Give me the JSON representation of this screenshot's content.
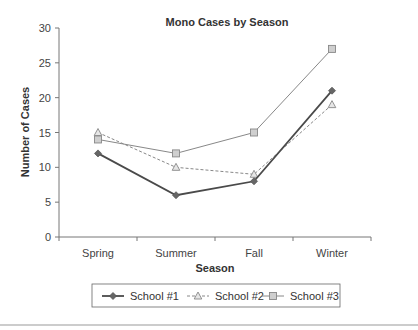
{
  "chart_data": {
    "type": "line",
    "title": "Mono Cases by Season",
    "xlabel": "Season",
    "ylabel": "Number of Cases",
    "categories": [
      "Spring",
      "Summer",
      "Fall",
      "Winter"
    ],
    "series": [
      {
        "name": "School #1",
        "values": [
          12,
          6,
          8,
          21
        ],
        "line": "solid-thick",
        "marker": "diamond",
        "color": "#555555"
      },
      {
        "name": "School #2",
        "values": [
          15,
          10,
          9,
          19
        ],
        "line": "dashed",
        "marker": "triangle",
        "color": "#888888"
      },
      {
        "name": "School #3",
        "values": [
          14,
          12,
          15,
          27
        ],
        "line": "solid-thin",
        "marker": "square",
        "color": "#888888"
      }
    ],
    "ylim": [
      0,
      30
    ],
    "yticks": [
      0,
      5,
      10,
      15,
      20,
      25,
      30
    ],
    "grid": false,
    "legend_position": "bottom"
  }
}
